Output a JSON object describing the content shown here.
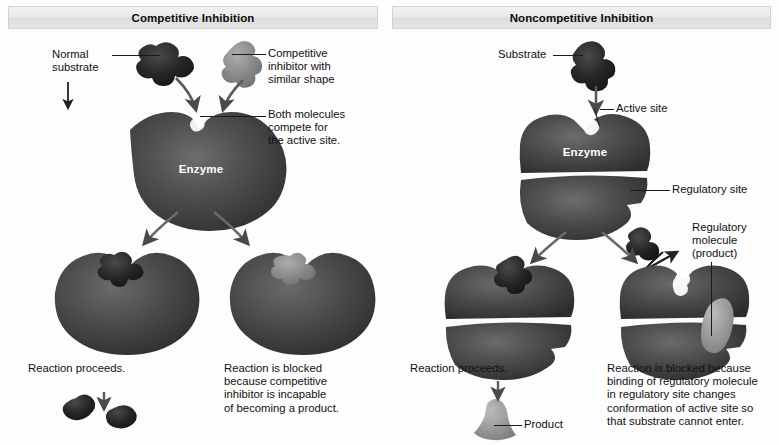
{
  "figure": {
    "background_color": "#fdfdfd"
  },
  "colors": {
    "substrate_dark": "#2b2b2b",
    "inhibitor_gray": "#8c8c8c",
    "enzyme_body": "#464646",
    "enzyme_highlight": "#6e6e6e",
    "product_gray": "#9a9a9a",
    "arrow": "#4a4a4a",
    "text": "#111111",
    "header_bg": "#e6e6e6",
    "label_on_enzyme": "#ffffff"
  },
  "panels": [
    {
      "id": "competitive",
      "header": "Competitive Inhibition",
      "labels": {
        "normal_substrate": "Normal\nsubstrate",
        "competitive_inhibitor": "Competitive\ninhibitor with\nsimilar shape",
        "both_molecules": "Both molecules\ncompete for\nthe active site.",
        "enzyme": "Enzyme",
        "outcome_left": "Reaction proceeds.",
        "outcome_right": "Reaction is blocked\nbecause competitive\ninhibitor is incapable\nof becoming a product."
      }
    },
    {
      "id": "noncompetitive",
      "header": "Noncompetitive Inhibition",
      "labels": {
        "substrate": "Substrate",
        "active_site": "Active site",
        "regulatory_site": "Regulatory site",
        "regulatory_molecule": "Regulatory\nmolecule\n(product)",
        "enzyme": "Enzyme",
        "outcome_left": "Reaction proceeds.",
        "outcome_right": "Reaction is blocked because\nbinding of regulatory molecule\nin regulatory site changes\nconformation of active site so\nthat substrate cannot enter.",
        "product": "Product"
      }
    }
  ]
}
